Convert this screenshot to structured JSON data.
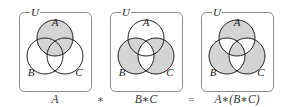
{
  "figure": {
    "colors": {
      "shade": "#d4d4d4",
      "stroke": "#222222",
      "frame": "#8a8a8a",
      "background": "#ffffff"
    },
    "universe_label": "U",
    "set_labels": {
      "a": "A",
      "b": "B",
      "c": "C"
    },
    "panels": [
      {
        "id": "panel-a",
        "caption": "A",
        "shaded_regions": [
          "A",
          "AB",
          "AC",
          "ABC"
        ]
      },
      {
        "id": "panel-b-sym-c",
        "caption": "B∗C",
        "shaded_regions": [
          "B",
          "C",
          "AB",
          "AC"
        ]
      },
      {
        "id": "panel-a-sym-b-sym-c",
        "caption": "A∗(B∗C)",
        "shaded_regions": [
          "A",
          "B",
          "C",
          "ABC"
        ]
      }
    ],
    "operators": [
      "∗",
      "="
    ]
  }
}
